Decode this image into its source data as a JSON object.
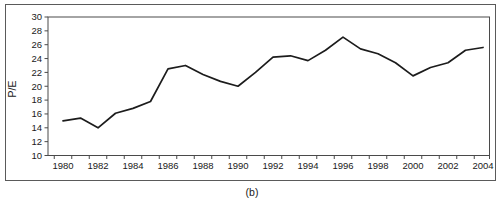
{
  "figure": {
    "caption": "(b)",
    "background": "#ffffff",
    "border_color": "#5a5a5a"
  },
  "chart_data": {
    "type": "line",
    "title": "",
    "xlabel": "",
    "ylabel": "P/E",
    "x": [
      1980,
      1981,
      1982,
      1983,
      1984,
      1985,
      1986,
      1987,
      1988,
      1989,
      1990,
      1991,
      1992,
      1993,
      1994,
      1995,
      1996,
      1997,
      1998,
      1999,
      2000,
      2001,
      2002,
      2003,
      2004
    ],
    "series": [
      {
        "name": "P/E",
        "values": [
          15.0,
          15.4,
          14.0,
          16.1,
          16.8,
          17.8,
          22.5,
          23.0,
          21.7,
          20.7,
          20.0,
          22.0,
          24.2,
          24.4,
          23.7,
          25.2,
          27.1,
          25.4,
          24.7,
          23.4,
          21.5,
          22.7,
          23.4,
          25.2,
          25.6
        ]
      }
    ],
    "ylim": [
      10,
      30
    ],
    "ytick_step": 2,
    "xtick_label_step": 2,
    "grid": false,
    "legend_position": "none",
    "line_color": "#1c1c1c",
    "axis_color": "#4a4a4a",
    "label_color": "#1a1a1a"
  }
}
